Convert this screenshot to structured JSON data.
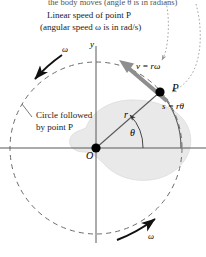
{
  "figure": {
    "name": "rotational-motion-diagram",
    "cut_off_caption": "the body moves (angle θ is in radians)",
    "caption_line_1": "Linear speed of point P",
    "caption_line_2": "(angular speed ω is in rad/s)",
    "circle_note_line_1": "Circle followed",
    "circle_note_line_2": "by point P"
  },
  "labels": {
    "y_axis": "y",
    "origin": "O",
    "point_p": "P",
    "radius": "r",
    "angle": "θ",
    "velocity_eq": "v = rω",
    "arc_eq": "s = rθ",
    "omega_top_left": "ω",
    "omega_bottom_right": "ω"
  },
  "colors": {
    "background": "#ffffff",
    "axis": "#555555",
    "dashed_circle": "#6b6b6b",
    "body_blob_fill": "#e9e9e9",
    "body_blob_stroke": "#d4d4d4",
    "velocity_arrow": "#8e8e8e",
    "omega_arrow": "#111111",
    "leader_dotted": "#9a9a9a",
    "point_marker": "#000000",
    "text": "#1a1a1a"
  },
  "geometry": {
    "origin_x": 96,
    "origin_y": 148,
    "point_p_x": 160,
    "point_p_y": 92,
    "circle_radius": 86,
    "angle_degrees": 41
  }
}
